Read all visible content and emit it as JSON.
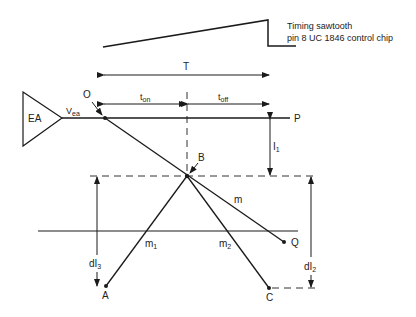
{
  "diagram": {
    "sawtooth_label_line1": "Timing sawtooth",
    "sawtooth_label_line2": "pin 8 UC 1846 control chip",
    "period_label": "T",
    "ton_label": "t",
    "ton_sub": "on",
    "toff_label": "t",
    "toff_sub": "off",
    "amplifier_label": "EA",
    "vea_label": "V",
    "vea_sub": "ea",
    "points": {
      "O": "O",
      "P": "P",
      "B": "B",
      "Q": "Q",
      "A": "A",
      "C": "C"
    },
    "slopes": {
      "m": "m",
      "m1": "m",
      "m1_sub": "1",
      "m2": "m",
      "m2_sub": "2"
    },
    "currents": {
      "I1": "I",
      "I1_sub": "1",
      "dI2": "dI",
      "dI2_sub": "2",
      "dI3": "dI",
      "dI3_sub": "3"
    },
    "colors": {
      "line": "#1a1a1a",
      "background": "#ffffff"
    }
  }
}
